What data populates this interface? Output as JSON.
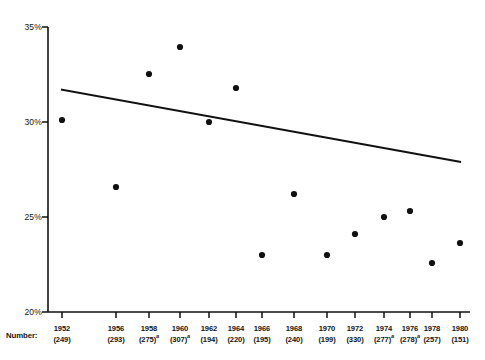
{
  "chart_data": {
    "type": "scatter",
    "title": "",
    "xlabel": "",
    "ylabel": "",
    "row_header_label": "Number:",
    "ylim": [
      20,
      35
    ],
    "yticks": [
      20,
      25,
      30,
      35
    ],
    "ytick_labels": [
      "20%",
      "25%",
      "30%",
      "35%"
    ],
    "grid": false,
    "legend": false,
    "x": [
      1952,
      1956,
      1958,
      1960,
      1962,
      1964,
      1966,
      1968,
      1970,
      1972,
      1974,
      1976,
      1978,
      1980
    ],
    "xtick_labels": [
      "1952",
      "1956",
      "1958",
      "1960",
      "1962",
      "1964",
      "1966",
      "1968",
      "1970",
      "1972",
      "1974",
      "1976",
      "1978",
      "1980"
    ],
    "counts": [
      "(249)",
      "(293)",
      "(275)",
      "(307)",
      "(194)",
      "(220)",
      "(195)",
      "(240)",
      "(199)",
      "(330)",
      "(277)",
      "(278)",
      "(257)",
      "(151)"
    ],
    "count_footnote_marks": [
      "",
      "",
      "a",
      "a",
      "",
      "",
      "",
      "",
      "",
      "",
      "a",
      "a",
      "",
      ""
    ],
    "values": [
      30.1,
      26.6,
      32.4,
      33.3,
      30.0,
      31.8,
      23.1,
      26.2,
      23.1,
      24.2,
      25.1,
      25.4,
      22.8,
      23.9
    ],
    "series": [
      {
        "name": "observed",
        "values": [
          30.1,
          26.6,
          32.4,
          33.3,
          30.0,
          31.8,
          23.1,
          26.2,
          23.1,
          24.2,
          25.1,
          25.4,
          22.8,
          23.9
        ]
      }
    ],
    "trend_line": {
      "name": "fitted-trend",
      "x_start": 1952,
      "y_start": 31.7,
      "x_end": 1980,
      "y_end": 27.9
    }
  },
  "geometry": {
    "axis_left_px": 48,
    "axis_right_px": 470,
    "axis_top_px": 27,
    "axis_bottom_px": 312,
    "point_x_px": [
      62,
      116,
      149,
      180,
      209,
      236,
      262,
      294,
      327,
      355,
      384,
      410,
      432,
      460
    ],
    "point_y_px": [
      120,
      187,
      74,
      47,
      122,
      88,
      255,
      194,
      255,
      234,
      217,
      211,
      263,
      243
    ],
    "tick_x_px": [
      62,
      116,
      149,
      180,
      209,
      236,
      262,
      294,
      327,
      355,
      384,
      410,
      432,
      460
    ]
  }
}
